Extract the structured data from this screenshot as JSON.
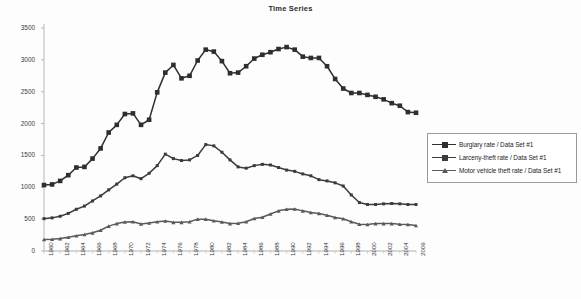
{
  "chart_data": {
    "type": "line",
    "title": "Time Series",
    "xlabel": "",
    "ylabel": "",
    "ylim": [
      0,
      3500
    ],
    "ytick_labels": [
      "0",
      "500",
      "1000",
      "1500",
      "2000",
      "2500",
      "3000",
      "3500"
    ],
    "ytick_values": [
      0,
      500,
      1000,
      1500,
      2000,
      2500,
      3000,
      3500
    ],
    "grid": false,
    "legend_position": "right",
    "x": [
      1960,
      1961,
      1962,
      1963,
      1964,
      1965,
      1966,
      1967,
      1968,
      1969,
      1970,
      1971,
      1972,
      1973,
      1974,
      1975,
      1976,
      1977,
      1978,
      1979,
      1980,
      1981,
      1982,
      1983,
      1984,
      1985,
      1986,
      1987,
      1988,
      1989,
      1990,
      1991,
      1992,
      1993,
      1994,
      1995,
      1996,
      1997,
      1998,
      1999,
      2000,
      2001,
      2002,
      2003,
      2004,
      2005,
      2006
    ],
    "xtick_labels": [
      "1960",
      "1962",
      "1964",
      "1966",
      "1968",
      "1970",
      "1972",
      "1974",
      "1976",
      "1978",
      "1980",
      "1982",
      "1984",
      "1986",
      "1988",
      "1990",
      "1992",
      "1994",
      "1996",
      "1998",
      "2000",
      "2002",
      "2004",
      "2006"
    ],
    "series": [
      {
        "name": "Burglary rate / Data Set #1",
        "marker": "square",
        "color": "#2e2e2e",
        "values": [
          1035,
          1045,
          1100,
          1190,
          1310,
          1320,
          1450,
          1610,
          1860,
          1980,
          2150,
          2160,
          1980,
          2060,
          2490,
          2800,
          2920,
          2710,
          2750,
          2990,
          3160,
          3130,
          2980,
          2790,
          2800,
          2900,
          3020,
          3080,
          3120,
          3170,
          3200,
          3160,
          3050,
          3030,
          3030,
          2900,
          2700,
          2550,
          2480,
          2480,
          2450,
          2420,
          2380,
          2320,
          2280,
          2180,
          2170
        ]
      },
      {
        "name": "Larceny-theft rate / Data Set #1",
        "marker": "square",
        "color": "#3b3b3b",
        "values": [
          508,
          520,
          545,
          590,
          655,
          705,
          785,
          865,
          960,
          1050,
          1150,
          1180,
          1135,
          1220,
          1340,
          1520,
          1450,
          1420,
          1430,
          1500,
          1670,
          1650,
          1550,
          1430,
          1320,
          1300,
          1340,
          1360,
          1350,
          1310,
          1270,
          1250,
          1210,
          1180,
          1120,
          1100,
          1070,
          1020,
          880,
          760,
          730,
          730,
          740,
          745,
          740,
          730,
          730
        ]
      },
      {
        "name": "Motor vehicle theft rate / Data Set #1",
        "marker": "triangle",
        "color": "#5a5a5a",
        "values": [
          180,
          185,
          195,
          215,
          240,
          260,
          285,
          325,
          390,
          430,
          455,
          460,
          425,
          440,
          460,
          470,
          450,
          450,
          460,
          500,
          500,
          475,
          455,
          430,
          435,
          460,
          510,
          530,
          580,
          630,
          655,
          660,
          630,
          605,
          590,
          560,
          525,
          505,
          460,
          420,
          415,
          430,
          430,
          430,
          420,
          415,
          400
        ]
      }
    ]
  },
  "legend": {
    "items": [
      {
        "label": "Burglary rate / Data Set #1",
        "marker_icon": "square-marker-icon"
      },
      {
        "label": "Larceny-theft rate / Data Set #1",
        "marker_icon": "square-marker-icon"
      },
      {
        "label": "Motor vehicle theft rate / Data Set #1",
        "marker_icon": "triangle-marker-icon"
      }
    ]
  }
}
